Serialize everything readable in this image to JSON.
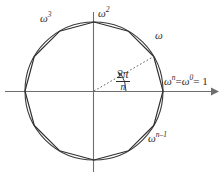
{
  "figure": {
    "colors": {
      "circle": "#3a3a3a",
      "polygon": "#2f2f2f",
      "axis": "#6e6e6e",
      "dotted_radius": "#5a5a5a",
      "text": "#2b2b2b",
      "background": "#ffffff"
    },
    "geometry": {
      "center_x": 94,
      "center_y": 91,
      "radius": 69,
      "polygon_sides": 12,
      "polygon_start_angle_deg": 0,
      "axis_x_start": 5,
      "axis_x_arrow_tip": 215,
      "axis_y_start": 12,
      "axis_y_end": 172,
      "dotted_radius_angle_deg": 30
    },
    "labels": {
      "omega_cubed": {
        "base": "ω",
        "exp": "3",
        "x": 40,
        "y": 13
      },
      "omega_squared": {
        "base": "ω",
        "exp": "2",
        "x": 98,
        "y": 8
      },
      "omega": {
        "base": "ω",
        "exp": "",
        "x": 155,
        "y": 30
      },
      "omega_n_minus_1": {
        "base": "ω",
        "exp": "n–1",
        "x": 148,
        "y": 133
      },
      "omega_n_equals_one": {
        "text": "ω",
        "exp1": "n",
        "eq1": "=",
        "base2": "ω",
        "exp2": "0",
        "eq2": "= 1",
        "x": 164,
        "y": 76
      }
    },
    "angle_annotation": {
      "numerator": "2π",
      "denominator": "n",
      "x": 116,
      "y": 69,
      "arc_label": "central angle between consecutive roots"
    }
  }
}
